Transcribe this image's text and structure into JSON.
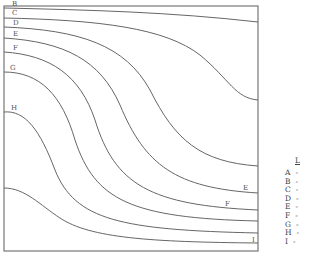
{
  "chart_data": {
    "type": "line",
    "subtype": "contour",
    "title": "",
    "xlabel": "",
    "ylabel": "",
    "grid": false,
    "legend_position": "right",
    "legend_title": "L",
    "legend": [
      {
        "key": "A",
        "value": "-"
      },
      {
        "key": "B",
        "value": "-"
      },
      {
        "key": "C",
        "value": "-"
      },
      {
        "key": "D",
        "value": "-"
      },
      {
        "key": "E",
        "value": "-"
      },
      {
        "key": "F",
        "value": "-"
      },
      {
        "key": "G",
        "value": "-"
      },
      {
        "key": "H",
        "value": "-"
      },
      {
        "key": "I",
        "value": "-"
      }
    ],
    "frame": {
      "x": 4,
      "y": 6,
      "width": 254,
      "height": 245
    },
    "series": [
      {
        "name": "B",
        "left_y": 8,
        "right_y": 22,
        "path": "M4,8 C90,10 170,12 258,22"
      },
      {
        "name": "C",
        "left_y": 18,
        "right_y": 100,
        "path": "M4,18 C100,20 165,28 200,55 C230,80 235,98 258,100"
      },
      {
        "name": "D",
        "left_y": 27,
        "right_y": 166,
        "path": "M4,27 C80,30 125,45 150,90 C175,140 200,162 258,166"
      },
      {
        "name": "E",
        "left_y": 38,
        "right_y": 193,
        "path": "M4,38 C65,42 100,60 120,105 C145,165 175,188 258,193"
      },
      {
        "name": "F",
        "left_y": 52,
        "right_y": 210,
        "path": "M4,52 C50,55 80,75 95,120 C115,185 150,205 258,210"
      },
      {
        "name": "G",
        "left_y": 72,
        "right_y": 221,
        "path": "M4,72 C40,72 62,95 75,140 C95,200 130,218 258,221"
      },
      {
        "name": "H",
        "left_y": 112,
        "right_y": 233,
        "path": "M4,112 C25,110 40,130 55,170 C75,220 120,230 258,233"
      },
      {
        "name": "I",
        "left_y": 188,
        "right_y": 243,
        "path": "M4,188 C25,188 40,205 60,218 C90,238 150,242 258,243"
      }
    ],
    "inline_labels": [
      {
        "text": "B",
        "x": 12,
        "y": 6
      },
      {
        "text": "C",
        "x": 12,
        "y": 15
      },
      {
        "text": "D",
        "x": 13,
        "y": 25
      },
      {
        "text": "E",
        "x": 13,
        "y": 36
      },
      {
        "text": "F",
        "x": 13,
        "y": 50
      },
      {
        "text": "G",
        "x": 10,
        "y": 70
      },
      {
        "text": "H",
        "x": 11,
        "y": 110
      },
      {
        "text": "E",
        "x": 243,
        "y": 190
      },
      {
        "text": "F",
        "x": 225,
        "y": 206
      },
      {
        "text": "I",
        "x": 252,
        "y": 242
      }
    ]
  }
}
